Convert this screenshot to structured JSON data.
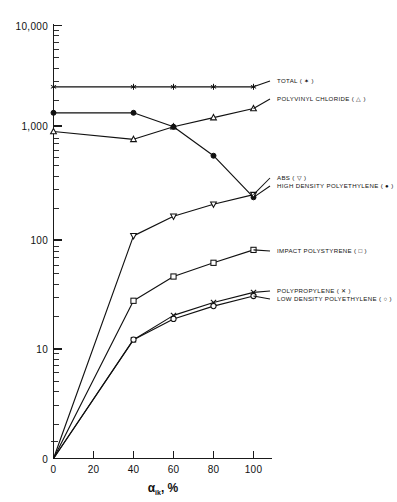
{
  "chart_data": {
    "type": "line",
    "title": "",
    "xlabel": "α ik , %",
    "xlabel_main": "α",
    "xlabel_sub": "ik",
    "xlabel_tail": ", %",
    "ylabel": "",
    "yscale": "log",
    "ylim": [
      1,
      10000
    ],
    "xlim": [
      0,
      100
    ],
    "grid": false,
    "legend_position": "right",
    "x_ticks": [
      0,
      20,
      40,
      60,
      80,
      100
    ],
    "x_tick_labels": [
      "0",
      "20",
      "40",
      "60",
      "80",
      "100"
    ],
    "y_ticks": [
      10000,
      1000,
      100,
      10,
      0
    ],
    "y_tick_labels": [
      "10,000",
      "1,000",
      "100",
      "10",
      "0"
    ],
    "series": [
      {
        "name": "TOTAL",
        "label": "TOTAL  ( ✶ )",
        "marker": "asterisk",
        "x": [
          0,
          40,
          60,
          80,
          100
        ],
        "values": [
          2700,
          2700,
          2700,
          2700,
          2700
        ]
      },
      {
        "name": "POLYVINYL CHLORIDE",
        "label": "POLYVINYL  CHLORIDE  ( △ )",
        "marker": "triangle-open",
        "x": [
          0,
          40,
          60,
          80,
          100
        ],
        "values": [
          1040,
          880,
          1150,
          1400,
          1700
        ]
      },
      {
        "name": "HIGH DENSITY POLYETHYLENE",
        "label": "HIGH  DENSITY  POLYETHYLENE  ( ● )",
        "marker": "circle-filled",
        "x": [
          0,
          40,
          60,
          80,
          100
        ],
        "values": [
          1550,
          1550,
          1150,
          620,
          255
        ]
      },
      {
        "name": "ABS",
        "label": "ABS  ( ▽ )",
        "marker": "triangle-down-open",
        "x": [
          0,
          40,
          60,
          80,
          100
        ],
        "values": [
          1,
          112,
          170,
          220,
          270
        ]
      },
      {
        "name": "IMPACT POLYSTYRENE",
        "label": "IMPACT  POLYSTYRENE  ( □ )",
        "marker": "square-open",
        "x": [
          0,
          40,
          60,
          80,
          100
        ],
        "values": [
          1,
          28,
          47,
          63,
          83
        ]
      },
      {
        "name": "POLYPROPYLENE",
        "label": "POLYPROPYLENE  ( ✕ )",
        "marker": "x-cross",
        "x": [
          0,
          40,
          60,
          80,
          100
        ],
        "values": [
          1,
          12.2,
          20.5,
          27.0,
          33.5
        ]
      },
      {
        "name": "LOW DENSITY POLYETHYLENE",
        "label": "LOW  DENSITY  POLYETHYLENE  ( ○ )",
        "marker": "circle-open",
        "x": [
          0,
          40,
          60,
          80,
          100
        ],
        "values": [
          1,
          12.2,
          19.0,
          25.0,
          31.0
        ]
      }
    ],
    "legend_entries": [
      {
        "id": "total",
        "text": "TOTAL  ( ✶ )"
      },
      {
        "id": "pvc",
        "text": "POLYVINYL  CHLORIDE  ( △ )"
      },
      {
        "id": "abs",
        "text": "ABS  ( ▽ )"
      },
      {
        "id": "hdpe",
        "text": "HIGH  DENSITY  POLYETHYLENE  ( ● )"
      },
      {
        "id": "ips",
        "text": "IMPACT  POLYSTYRENE  ( □ )"
      },
      {
        "id": "pp",
        "text": "POLYPROPYLENE  ( ✕ )"
      },
      {
        "id": "ldpe",
        "text": "LOW  DENSITY  POLYETHYLENE  ( ○ )"
      }
    ],
    "colors": {
      "line": "#111111",
      "axis": "#1a1a1a",
      "background": "#ffffff"
    }
  }
}
